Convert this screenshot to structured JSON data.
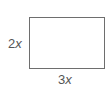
{
  "diagram": {
    "shape": "rectangle",
    "height_label": {
      "coef": "2",
      "var": "x"
    },
    "width_label": {
      "coef": "3",
      "var": "x"
    },
    "stroke_color": "#6e6e6e",
    "label_color": "#555555"
  }
}
